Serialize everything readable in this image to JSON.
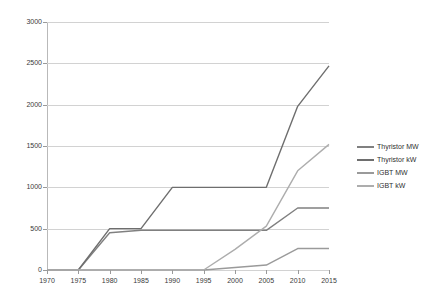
{
  "chart_data": {
    "type": "line",
    "title": "",
    "xlabel": "",
    "ylabel": "",
    "xlim": [
      1970,
      2015
    ],
    "ylim": [
      0,
      3000
    ],
    "grid": true,
    "legend_position": "right",
    "x_ticks": [
      "1970",
      "1975",
      "1980",
      "1985",
      "1990",
      "1995",
      "2000",
      "2005",
      "2010",
      "2015"
    ],
    "y_ticks": [
      "0",
      "500",
      "1000",
      "1500",
      "2000",
      "2500",
      "3000"
    ],
    "x": [
      1970,
      1975,
      1980,
      1985,
      1990,
      1995,
      2000,
      2005,
      2010,
      2015
    ],
    "series": [
      {
        "name": "Thyristor MW",
        "color": "#808080",
        "values": [
          0,
          0,
          450,
          480,
          480,
          480,
          480,
          480,
          750,
          750
        ]
      },
      {
        "name": "Thyristor kW",
        "color": "#6e6e6e",
        "values": [
          0,
          0,
          500,
          500,
          1000,
          1000,
          1000,
          1000,
          1980,
          2470
        ]
      },
      {
        "name": "IGBT MW",
        "color": "#9a9a9a",
        "values": [
          0,
          0,
          0,
          0,
          0,
          0,
          30,
          60,
          260,
          260
        ]
      },
      {
        "name": "IGBT kW",
        "color": "#adadad",
        "values": [
          0,
          0,
          0,
          0,
          0,
          0,
          250,
          530,
          1200,
          1520
        ]
      }
    ]
  },
  "legend": {
    "entries": [
      {
        "label": "Thyristor MW",
        "color": "#808080"
      },
      {
        "label": "Thyristor kW",
        "color": "#6e6e6e"
      },
      {
        "label": "IGBT MW",
        "color": "#9a9a9a"
      },
      {
        "label": "IGBT kW",
        "color": "#adadad"
      }
    ]
  }
}
